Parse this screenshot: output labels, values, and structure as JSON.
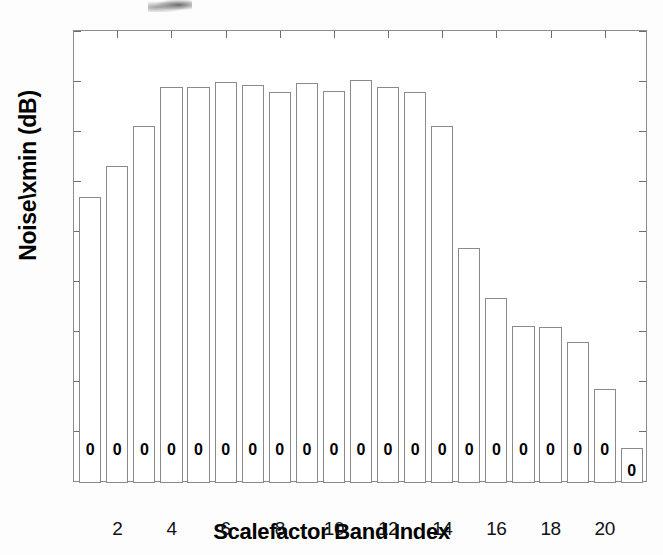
{
  "chart_data": {
    "type": "bar",
    "title": "",
    "xlabel": "Scalefactor Band Index",
    "ylabel": "Noise\\xmin (dB)",
    "categories": [
      1,
      2,
      3,
      4,
      5,
      6,
      7,
      8,
      9,
      10,
      11,
      12,
      13,
      14,
      15,
      16,
      17,
      18,
      19,
      20,
      21
    ],
    "values": [
      73.5,
      86,
      102,
      117.5,
      117.5,
      119.5,
      118.5,
      115.5,
      119,
      116,
      120.5,
      117.5,
      115.5,
      102,
      53,
      33,
      22,
      21.5,
      15.5,
      -3.5,
      -27
    ],
    "bar_text_labels": [
      "0",
      "0",
      "0",
      "0",
      "0",
      "0",
      "0",
      "0",
      "0",
      "0",
      "0",
      "0",
      "0",
      "0",
      "0",
      "0",
      "0",
      "0",
      "0",
      "0",
      "0"
    ],
    "ylim": [
      -41,
      140
    ],
    "xlim": [
      0.4,
      21.6
    ],
    "yticks": [
      140,
      120,
      100,
      80,
      60,
      40,
      20,
      0,
      -20
    ],
    "ytick_labels": [
      "140",
      "120",
      "100",
      "80",
      "60",
      "40",
      "20",
      "0",
      "-20"
    ],
    "xticks": [
      2,
      4,
      6,
      8,
      10,
      12,
      14,
      16,
      18,
      20
    ],
    "xtick_labels": [
      "2",
      "4",
      "6",
      "8",
      "10",
      "12",
      "14",
      "16",
      "18",
      "20"
    ],
    "grid": false,
    "legend": null,
    "bar_face_color": "#ffffff",
    "bar_edge_color": "#8a8a8a",
    "axis_color": "#8d8d8d"
  }
}
